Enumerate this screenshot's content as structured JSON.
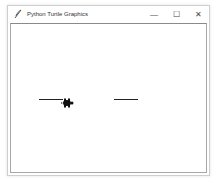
{
  "window": {
    "title": "Python Turtle Graphics",
    "icon": "feather-icon",
    "controls": {
      "minimize": "—",
      "maximize": "☐",
      "close": "✕"
    }
  },
  "canvas": {
    "background": "#ffffff",
    "pen_color": "#000000",
    "segments": [
      {
        "x1": 39,
        "y1": 99,
        "x2": 62,
        "y2": 99
      },
      {
        "x1": 114,
        "y1": 99,
        "x2": 138,
        "y2": 99
      }
    ],
    "turtle": {
      "shape": "turtle",
      "x": 66,
      "y": 99,
      "heading": 0
    }
  }
}
